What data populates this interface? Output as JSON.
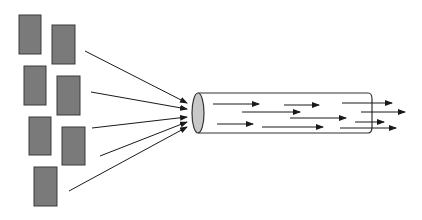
{
  "diagram": {
    "colors": {
      "block_fill": "#7a7a7a",
      "block_stroke": "#3a3a3a",
      "arrow": "#1a1a1a",
      "pipe_stroke": "#333333",
      "pipe_end_fill": "#c8c8c8",
      "background": "#ffffff"
    },
    "blocks": [
      {
        "x": 19,
        "y": 15,
        "w": 22,
        "h": 39
      },
      {
        "x": 52,
        "y": 25,
        "w": 23,
        "h": 39
      },
      {
        "x": 24,
        "y": 66,
        "w": 22,
        "h": 39
      },
      {
        "x": 57,
        "y": 76,
        "w": 23,
        "h": 39
      },
      {
        "x": 29,
        "y": 117,
        "w": 22,
        "h": 38
      },
      {
        "x": 62,
        "y": 127,
        "w": 23,
        "h": 38
      },
      {
        "x": 34,
        "y": 167,
        "w": 23,
        "h": 39
      }
    ],
    "converging_arrows": [
      {
        "x1": 85,
        "y1": 51,
        "x2": 187,
        "y2": 103
      },
      {
        "x1": 91,
        "y1": 92,
        "x2": 187,
        "y2": 109
      },
      {
        "x1": 92,
        "y1": 128,
        "x2": 187,
        "y2": 117
      },
      {
        "x1": 100,
        "y1": 156,
        "x2": 187,
        "y2": 122
      },
      {
        "x1": 69,
        "y1": 191,
        "x2": 187,
        "y2": 127
      }
    ],
    "pipe": {
      "left_cx": 198,
      "cy": 113,
      "rx": 6,
      "ry": 20,
      "right_x": 372
    },
    "flow_arrows": [
      {
        "x1": 213,
        "y1": 104,
        "x2": 259,
        "y2": 104
      },
      {
        "x1": 284,
        "y1": 105,
        "x2": 319,
        "y2": 105
      },
      {
        "x1": 342,
        "y1": 103,
        "x2": 392,
        "y2": 103
      },
      {
        "x1": 242,
        "y1": 112,
        "x2": 300,
        "y2": 112
      },
      {
        "x1": 361,
        "y1": 112,
        "x2": 405,
        "y2": 112
      },
      {
        "x1": 290,
        "y1": 118,
        "x2": 346,
        "y2": 118
      },
      {
        "x1": 355,
        "y1": 122,
        "x2": 384,
        "y2": 122
      },
      {
        "x1": 217,
        "y1": 124,
        "x2": 253,
        "y2": 124
      },
      {
        "x1": 262,
        "y1": 127,
        "x2": 323,
        "y2": 127
      },
      {
        "x1": 340,
        "y1": 128,
        "x2": 396,
        "y2": 128
      }
    ]
  }
}
